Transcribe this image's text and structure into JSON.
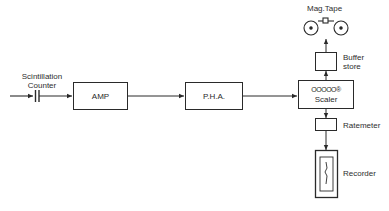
{
  "diagram": {
    "type": "block-diagram",
    "nodes": {
      "detector": {
        "label_line1": "Scintillation",
        "label_line2": "Counter"
      },
      "amp": {
        "label": "AMP"
      },
      "pha": {
        "label": "P.H.A."
      },
      "scaler": {
        "label": "Scaler",
        "digits": "OOOOO®"
      },
      "buffer": {
        "label_line1": "Buffer",
        "label_line2": "store"
      },
      "magtape": {
        "label": "Mag.Tape"
      },
      "ratemeter": {
        "label": "Ratemeter"
      },
      "recorder": {
        "label": "Recorder"
      }
    },
    "edges": [
      {
        "from": "detector",
        "to": "amp"
      },
      {
        "from": "amp",
        "to": "pha"
      },
      {
        "from": "pha",
        "to": "scaler"
      },
      {
        "from": "scaler",
        "to": "buffer"
      },
      {
        "from": "buffer",
        "to": "magtape"
      },
      {
        "from": "scaler",
        "to": "ratemeter"
      },
      {
        "from": "ratemeter",
        "to": "recorder"
      }
    ],
    "colors": {
      "line": "#2a2a2a",
      "background": "#ffffff"
    }
  }
}
